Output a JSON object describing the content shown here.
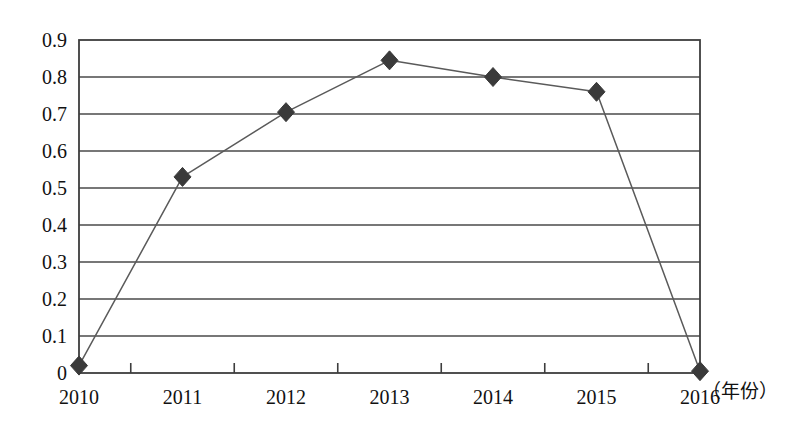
{
  "chart_data": {
    "type": "line",
    "title": "",
    "xlabel": "（年份）",
    "ylabel": "",
    "categories": [
      "2010",
      "2011",
      "2012",
      "2013",
      "2014",
      "2015",
      "2016"
    ],
    "values": [
      0.02,
      0.53,
      0.705,
      0.845,
      0.8,
      0.76,
      0.005
    ],
    "series": [
      {
        "name": "",
        "values": [
          0.02,
          0.53,
          0.705,
          0.845,
          0.8,
          0.76,
          0.005
        ]
      }
    ],
    "ylim": [
      0,
      0.9
    ],
    "ytick_labels": [
      "0.9",
      "0.8",
      "0.7",
      "0.6",
      "0.5",
      "0.4",
      "0.3",
      "0.2",
      "0.1",
      "0"
    ],
    "ytick_values": [
      0.9,
      0.8,
      0.7,
      0.6,
      0.5,
      0.4,
      0.3,
      0.2,
      0.1,
      0
    ],
    "grid": true,
    "grid_axis": "y",
    "legend": false,
    "legend_position": "none",
    "marker": "diamond",
    "marker_color": "#3a3a3a",
    "line_color": "#5a5a5a",
    "axis_color": "#3d3d3d",
    "grid_color": "#4a4a4a",
    "background_color": "#ffffff"
  },
  "axis": {
    "x_title": "（年份）"
  }
}
